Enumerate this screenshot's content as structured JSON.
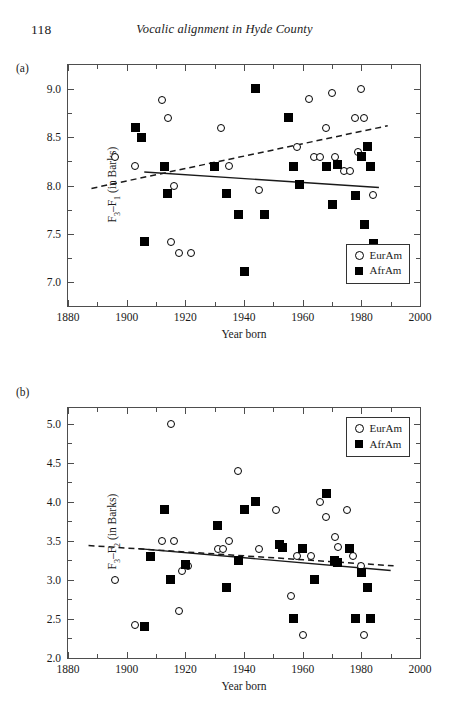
{
  "header": {
    "folio": "118",
    "running_head": "Vocalic alignment in Hyde County"
  },
  "legend": {
    "eur_label": "EurAm",
    "afr_label": "AfrAm",
    "eur_icon": "open-circle-marker",
    "afr_icon": "filled-square-marker"
  },
  "panels": {
    "a": {
      "label": "(a)",
      "ylabel": "F3–F1 (in Barks)",
      "xlabel": "Year born",
      "yticks": [
        "7.0",
        "7.5",
        "8.0",
        "8.5",
        "9.0"
      ],
      "xticks": [
        "1880",
        "1900",
        "1920",
        "1940",
        "1960",
        "1980",
        "2000"
      ]
    },
    "b": {
      "label": "(b)",
      "ylabel": "F3–F2 (in Barks)",
      "xlabel": "Year born",
      "yticks": [
        "2.0",
        "2.5",
        "3.0",
        "3.5",
        "4.0",
        "4.5",
        "5.0"
      ],
      "xticks": [
        "1880",
        "1900",
        "1920",
        "1940",
        "1960",
        "1980",
        "2000"
      ]
    }
  },
  "chart_data": [
    {
      "type": "scatter",
      "panel": "a",
      "title": "",
      "xlabel": "Year born",
      "ylabel": "F3-F1 (in Barks)",
      "xlim": [
        1880,
        2000
      ],
      "ylim": [
        6.75,
        9.25
      ],
      "xtick_values": [
        1880,
        1900,
        1920,
        1940,
        1960,
        1980,
        2000
      ],
      "ytick_values": [
        7.0,
        7.5,
        8.0,
        8.5,
        9.0
      ],
      "grid": false,
      "legend_position": "bottom-right",
      "series": [
        {
          "name": "EurAm",
          "marker": "open-circle",
          "points": [
            [
              1896,
              8.3
            ],
            [
              1903,
              8.2
            ],
            [
              1912,
              8.89
            ],
            [
              1914,
              8.7
            ],
            [
              1915,
              7.41
            ],
            [
              1916,
              8.0
            ],
            [
              1918,
              7.3
            ],
            [
              1922,
              7.3
            ],
            [
              1932,
              8.6
            ],
            [
              1935,
              8.2
            ],
            [
              1945,
              7.95
            ],
            [
              1958,
              8.4
            ],
            [
              1962,
              8.9
            ],
            [
              1964,
              8.3
            ],
            [
              1966,
              8.3
            ],
            [
              1968,
              8.6
            ],
            [
              1970,
              8.96
            ],
            [
              1971,
              8.3
            ],
            [
              1974,
              8.15
            ],
            [
              1976,
              8.15
            ],
            [
              1978,
              8.7
            ],
            [
              1979,
              8.35
            ],
            [
              1980,
              9.0
            ],
            [
              1981,
              8.7
            ],
            [
              1983,
              8.2
            ],
            [
              1984,
              7.9
            ]
          ]
        },
        {
          "name": "AfrAm",
          "marker": "filled-square",
          "points": [
            [
              1903,
              8.6
            ],
            [
              1905,
              8.5
            ],
            [
              1906,
              7.42
            ],
            [
              1913,
              8.2
            ],
            [
              1914,
              7.92
            ],
            [
              1930,
              8.2
            ],
            [
              1934,
              7.92
            ],
            [
              1938,
              7.7
            ],
            [
              1940,
              7.11
            ],
            [
              1944,
              9.01
            ],
            [
              1947,
              7.7
            ],
            [
              1955,
              8.71
            ],
            [
              1957,
              8.2
            ],
            [
              1959,
              8.01
            ],
            [
              1968,
              8.2
            ],
            [
              1970,
              7.8
            ],
            [
              1972,
              8.22
            ],
            [
              1978,
              7.9
            ],
            [
              1980,
              8.3
            ],
            [
              1981,
              7.6
            ],
            [
              1982,
              8.4
            ],
            [
              1983,
              8.2
            ],
            [
              1984,
              7.4
            ]
          ]
        }
      ],
      "trend_lines": [
        {
          "name": "EurAm-fit",
          "style": "dashed",
          "x": [
            1888,
            1989
          ],
          "y": [
            7.97,
            8.62
          ]
        },
        {
          "name": "AfrAm-fit",
          "style": "solid",
          "x": [
            1906,
            1986
          ],
          "y": [
            8.14,
            7.98
          ]
        }
      ]
    },
    {
      "type": "scatter",
      "panel": "b",
      "title": "",
      "xlabel": "Year born",
      "ylabel": "F3-F2 (in Barks)",
      "xlim": [
        1880,
        2000
      ],
      "ylim": [
        2.0,
        5.2
      ],
      "xtick_values": [
        1880,
        1900,
        1920,
        1940,
        1960,
        1980,
        2000
      ],
      "ytick_values": [
        2.0,
        2.5,
        3.0,
        3.5,
        4.0,
        4.5,
        5.0
      ],
      "grid": false,
      "legend_position": "top-right",
      "series": [
        {
          "name": "EurAm",
          "marker": "open-circle",
          "points": [
            [
              1896,
              3.0
            ],
            [
              1903,
              2.42
            ],
            [
              1912,
              3.5
            ],
            [
              1915,
              5.0
            ],
            [
              1916,
              3.5
            ],
            [
              1918,
              2.6
            ],
            [
              1919,
              3.12
            ],
            [
              1921,
              3.18
            ],
            [
              1931,
              3.4
            ],
            [
              1933,
              3.4
            ],
            [
              1935,
              3.5
            ],
            [
              1938,
              4.4
            ],
            [
              1945,
              3.4
            ],
            [
              1951,
              3.9
            ],
            [
              1956,
              2.8
            ],
            [
              1958,
              3.3
            ],
            [
              1960,
              2.3
            ],
            [
              1963,
              3.3
            ],
            [
              1966,
              4.0
            ],
            [
              1968,
              3.8
            ],
            [
              1971,
              3.55
            ],
            [
              1972,
              3.42
            ],
            [
              1975,
              3.9
            ],
            [
              1977,
              3.3
            ],
            [
              1980,
              3.18
            ],
            [
              1981,
              2.3
            ]
          ]
        },
        {
          "name": "AfrAm",
          "marker": "filled-square",
          "points": [
            [
              1906,
              2.4
            ],
            [
              1908,
              3.3
            ],
            [
              1913,
              3.9
            ],
            [
              1915,
              3.0
            ],
            [
              1920,
              3.2
            ],
            [
              1931,
              3.7
            ],
            [
              1934,
              2.9
            ],
            [
              1938,
              3.25
            ],
            [
              1940,
              3.9
            ],
            [
              1944,
              4.0
            ],
            [
              1952,
              3.45
            ],
            [
              1953,
              3.42
            ],
            [
              1957,
              2.5
            ],
            [
              1960,
              3.4
            ],
            [
              1964,
              3.0
            ],
            [
              1968,
              4.1
            ],
            [
              1971,
              3.25
            ],
            [
              1972,
              3.22
            ],
            [
              1976,
              3.4
            ],
            [
              1978,
              2.5
            ],
            [
              1980,
              3.1
            ],
            [
              1982,
              2.9
            ],
            [
              1983,
              2.5
            ]
          ]
        }
      ],
      "trend_lines": [
        {
          "name": "EurAm-fit",
          "style": "dashed",
          "x": [
            1887,
            1991
          ],
          "y": [
            3.44,
            3.18
          ]
        },
        {
          "name": "AfrAm-fit",
          "style": "solid",
          "x": [
            1904,
            1990
          ],
          "y": [
            3.4,
            3.12
          ]
        }
      ]
    }
  ]
}
